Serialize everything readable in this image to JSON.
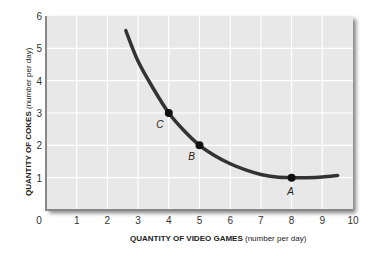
{
  "chart_data": {
    "type": "line",
    "title": "",
    "xlabel": {
      "bold": "QUANTITY OF VIDEO GAMES",
      "normal": " (number per day)"
    },
    "ylabel": {
      "bold": "QUANTITY OF COKES",
      "normal": " (number per day)"
    },
    "xlim": [
      0,
      10
    ],
    "ylim": [
      0,
      6
    ],
    "x_ticks": [
      "0",
      "1",
      "2",
      "3",
      "4",
      "5",
      "6",
      "7",
      "8",
      "9",
      "10"
    ],
    "y_ticks": [
      "1",
      "2",
      "3",
      "4",
      "5",
      "6"
    ],
    "grid": true,
    "series": [
      {
        "name": "Indifference curve",
        "x": [
          2.6,
          3.0,
          3.5,
          4.0,
          4.5,
          5.0,
          5.5,
          6.0,
          6.5,
          7.0,
          7.5,
          8.0,
          8.5,
          9.0,
          9.5
        ],
        "y": [
          5.55,
          4.6,
          3.75,
          3.0,
          2.45,
          2.0,
          1.68,
          1.43,
          1.24,
          1.1,
          1.02,
          1.0,
          1.0,
          1.02,
          1.07
        ]
      }
    ],
    "points": [
      {
        "label": "C",
        "x": 4,
        "y": 3
      },
      {
        "label": "B",
        "x": 5,
        "y": 2
      },
      {
        "label": "A",
        "x": 8,
        "y": 1
      }
    ],
    "colors": {
      "plot_bg": "#e8e8e8",
      "grid": "#ffffff",
      "curve": "#333333",
      "axis": "#888888"
    }
  }
}
